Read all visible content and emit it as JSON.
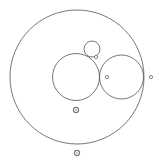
{
  "diagram": {
    "title": "",
    "width": 159,
    "height": 161,
    "background": "#ffffff",
    "stroke_color": "#555555",
    "circles": [
      {
        "id": "outer-circle",
        "cx": 77,
        "cy": 77,
        "r": 67
      },
      {
        "id": "left-inner-circle",
        "cx": 76,
        "cy": 77,
        "r": 23.5
      },
      {
        "id": "right-inner-circle",
        "cx": 121.5,
        "cy": 77,
        "r": 22
      },
      {
        "id": "small-top-circle",
        "cx": 92,
        "cy": 49,
        "r": 8
      }
    ],
    "points": [
      {
        "id": "point-tangent-small",
        "cx": 96,
        "cy": 57,
        "style": "hollow"
      },
      {
        "id": "point-right-inner-center",
        "cx": 107,
        "cy": 77,
        "style": "hollow"
      },
      {
        "id": "point-outer-right",
        "cx": 151,
        "cy": 77,
        "style": "hollow"
      },
      {
        "id": "point-below-left-circle",
        "cx": 76,
        "cy": 110,
        "style": "ring"
      },
      {
        "id": "point-below-outer",
        "cx": 77,
        "cy": 153,
        "style": "ring"
      }
    ]
  }
}
